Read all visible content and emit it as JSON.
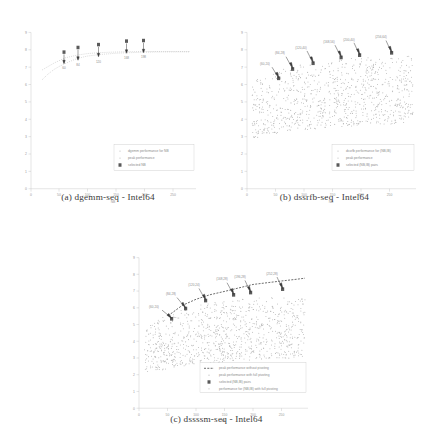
{
  "figure": {
    "panels": [
      {
        "id": "a",
        "caption": "(a) dgemm-seq - Intel64",
        "chart_data": {
          "type": "scatter",
          "title": "",
          "xlabel": "NB",
          "ylabel": "",
          "xlim": [
            0,
            290
          ],
          "ylim": [
            0,
            9
          ],
          "xticks": [
            0,
            50,
            100,
            150,
            200,
            250
          ],
          "yticks": [
            0,
            1,
            2,
            3,
            4,
            5,
            6,
            7,
            8,
            9
          ],
          "grid": false,
          "legend_position": "lower-right",
          "legend": [
            "dgemm performance for NB",
            "peak performance",
            "selected NB"
          ],
          "series": [
            {
              "name": "dgemm performance for NB",
              "marker": "dots",
              "x": [
                20,
                30,
                40,
                50,
                60,
                70,
                80,
                90,
                100,
                110,
                120,
                130,
                140,
                150,
                160,
                170,
                180,
                190,
                200,
                210,
                220,
                230,
                240,
                250,
                260,
                270,
                280
              ],
              "values": [
                6.3,
                6.6,
                6.85,
                7.0,
                7.15,
                7.3,
                7.45,
                7.55,
                7.62,
                7.68,
                7.72,
                7.75,
                7.78,
                7.8,
                7.82,
                7.84,
                7.85,
                7.86,
                7.87,
                7.87,
                7.88,
                7.88,
                7.88,
                7.88,
                7.88,
                7.88,
                7.88
              ]
            },
            {
              "name": "peak performance",
              "marker": "dots",
              "x": [
                20,
                40,
                60,
                80,
                100,
                120,
                140,
                160,
                180,
                200,
                220,
                240,
                260,
                280
              ],
              "values": [
                6.9,
                7.3,
                7.6,
                7.75,
                7.85,
                7.9,
                7.93,
                7.95,
                7.96,
                7.97,
                7.97,
                7.97,
                7.97,
                7.97
              ]
            }
          ],
          "selected_points": [
            {
              "label": "60",
              "x": 60,
              "y": 7.55
            },
            {
              "label": "84",
              "x": 84,
              "y": 7.8
            },
            {
              "label": "120",
              "x": 120,
              "y": 7.92
            },
            {
              "label": "168",
              "x": 168,
              "y": 8.08
            },
            {
              "label": "198",
              "x": 198,
              "y": 8.1
            }
          ]
        }
      },
      {
        "id": "b",
        "caption": "(b) dssrfb-seq - Intel64",
        "chart_data": {
          "type": "scatter",
          "title": "",
          "xlabel": "NB",
          "ylabel": "",
          "xlim": [
            0,
            290
          ],
          "ylim": [
            0,
            9
          ],
          "xticks": [
            0,
            50,
            100,
            150,
            200,
            250
          ],
          "yticks": [
            0,
            1,
            2,
            3,
            4,
            5,
            6,
            7,
            8,
            9
          ],
          "grid": false,
          "legend_position": "lower-right",
          "legend": [
            "dssrfb performance for (NB,IB)",
            "peak performance",
            "selected (NB,IB) pairs"
          ],
          "series": [
            {
              "name": "dssrfb performance for (NB,IB)",
              "marker": "dots",
              "cloud": true,
              "x_range": [
                25,
                285
              ],
              "y_range": [
                2.6,
                7.3
              ]
            },
            {
              "name": "peak performance",
              "marker": "dots",
              "x": [
                30,
                60,
                90,
                120,
                150,
                180,
                210,
                240,
                270,
                285
              ],
              "values": [
                6.1,
                6.6,
                6.9,
                7.05,
                7.15,
                7.2,
                7.25,
                7.28,
                7.3,
                7.3
              ]
            }
          ],
          "selected_points": [
            {
              "label": "(60,20)",
              "x": 60,
              "y": 6.25
            },
            {
              "label": "(84,28)",
              "x": 84,
              "y": 6.75
            },
            {
              "label": "(120,40)",
              "x": 120,
              "y": 7.05
            },
            {
              "label": "(168,56)",
              "x": 168,
              "y": 7.35
            },
            {
              "label": "(200,40)",
              "x": 200,
              "y": 7.45
            },
            {
              "label": "(256,64)",
              "x": 256,
              "y": 7.5
            }
          ]
        }
      },
      {
        "id": "c",
        "caption": "(c) dssssm-seq - Intel64",
        "chart_data": {
          "type": "scatter",
          "title": "",
          "xlabel": "NB",
          "ylabel": "",
          "xlim": [
            0,
            290
          ],
          "ylim": [
            0,
            9
          ],
          "xticks": [
            0,
            50,
            100,
            150,
            200,
            250
          ],
          "yticks": [
            0,
            1,
            2,
            3,
            4,
            5,
            6,
            7,
            8,
            9
          ],
          "grid": false,
          "legend_position": "lower-right",
          "legend": [
            "peak performance without pivoting",
            "peak performance with full pivoting",
            "selected (NB,IB) pairs",
            "performance for (NB,IB) with full pivoting"
          ],
          "series": [
            {
              "name": "performance for (NB,IB) with full pivoting",
              "marker": "dots",
              "cloud": true,
              "x_range": [
                25,
                285
              ],
              "y_range": [
                2.4,
                6.9
              ]
            },
            {
              "name": "peak performance without pivoting",
              "marker": "dashed-line",
              "x": [
                50,
                75,
                100,
                125,
                150,
                175,
                200,
                225,
                250,
                275,
                285
              ],
              "values": [
                5.4,
                6.05,
                6.45,
                6.7,
                6.9,
                7.05,
                7.2,
                7.3,
                7.4,
                7.5,
                7.55
              ]
            },
            {
              "name": "peak performance with full pivoting",
              "marker": "dots",
              "x": [
                50,
                80,
                110,
                140,
                170,
                200,
                230,
                260,
                285
              ],
              "values": [
                5.3,
                5.9,
                6.2,
                6.4,
                6.55,
                6.65,
                6.75,
                6.8,
                6.85
              ]
            }
          ],
          "selected_points": [
            {
              "label": "(60,20)",
              "x": 60,
              "y": 5.5
            },
            {
              "label": "(84,28)",
              "x": 84,
              "y": 6.1
            },
            {
              "label": "(120,24)",
              "x": 120,
              "y": 6.6
            },
            {
              "label": "(168,28)",
              "x": 168,
              "y": 6.95
            },
            {
              "label": "(196,28)",
              "x": 196,
              "y": 7.1
            },
            {
              "label": "(252,28)",
              "x": 252,
              "y": 7.25
            }
          ]
        }
      }
    ]
  }
}
